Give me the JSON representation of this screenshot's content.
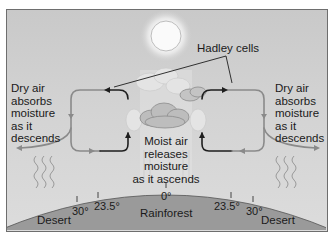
{
  "diagram": {
    "title_label": "Hadley cells",
    "left_annotation": [
      "Dry air",
      "absorbs",
      "moisture",
      "as it",
      "descends"
    ],
    "right_annotation": [
      "Dry air",
      "absorbs",
      "moisture",
      "as it",
      "descends"
    ],
    "center_annotation": [
      "Moist air",
      "releases",
      "moisture",
      "as it ascends"
    ],
    "latitudes": {
      "left_30": "30°",
      "left_23_5": "23.5°",
      "equator": "0°",
      "right_23_5": "23.5°",
      "right_30": "30°"
    },
    "zones": {
      "left": "Desert",
      "center": "Rainforest",
      "right": "Desert"
    },
    "elements": [
      "sun-icon",
      "cloud-icon",
      "hadley-cell-left",
      "hadley-cell-right",
      "heat-waves",
      "earth-surface"
    ],
    "colors": {
      "sky": "#d0d0d0",
      "earth": "#9a9a9a",
      "frame": "#6e6e6e",
      "loop_gray": "#8a8a8a",
      "loop_dark": "#1e1e1e"
    }
  }
}
